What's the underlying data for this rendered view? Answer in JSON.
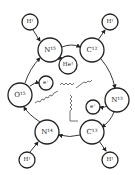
{
  "diagram": {
    "nodes": {
      "h1_top_left": "H¹",
      "h1_top_right": "H¹",
      "n15": "N¹⁵",
      "c12": "C¹²",
      "he4": "He⁴",
      "o15": "O¹⁵",
      "e_plus_left": "e⁺",
      "n13": "N¹³",
      "e_plus_right": "e⁺",
      "n14": "N¹⁴",
      "c13": "C¹³",
      "h1_bottom_left": "H¹",
      "h1_bottom_right": "H¹"
    },
    "colors": {
      "stroke": "#222222",
      "background": "#ffffff"
    }
  }
}
